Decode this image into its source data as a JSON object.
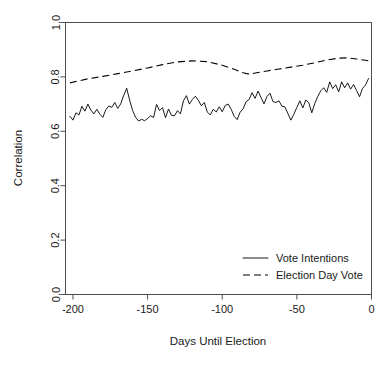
{
  "chart_data": {
    "type": "line",
    "title": "",
    "xlabel": "Days Until Election",
    "ylabel": "Correlation",
    "xlim": [
      -205,
      0
    ],
    "ylim": [
      0.0,
      1.0
    ],
    "grid": false,
    "legend_position": "bottom-right",
    "xticks": [
      -200,
      -150,
      -100,
      -50,
      0
    ],
    "xtick_labels": [
      "-200",
      "-150",
      "-100",
      "-50",
      "0"
    ],
    "yticks": [
      0.0,
      0.2,
      0.4,
      0.6,
      0.8,
      1.0
    ],
    "ytick_labels": [
      "0.0",
      "0.2",
      "0.4",
      "0.6",
      "0.8",
      "1.0"
    ],
    "series": [
      {
        "name": "Vote Intentions",
        "style": "solid",
        "color": "#000000",
        "x": [
          -202,
          -200,
          -198,
          -196,
          -194,
          -192,
          -190,
          -188,
          -186,
          -184,
          -182,
          -180,
          -178,
          -176,
          -174,
          -172,
          -170,
          -168,
          -166,
          -164,
          -162,
          -160,
          -158,
          -156,
          -154,
          -152,
          -150,
          -148,
          -146,
          -144,
          -142,
          -140,
          -138,
          -136,
          -134,
          -132,
          -130,
          -128,
          -126,
          -124,
          -122,
          -120,
          -118,
          -116,
          -114,
          -112,
          -110,
          -108,
          -106,
          -104,
          -102,
          -100,
          -98,
          -96,
          -94,
          -92,
          -90,
          -88,
          -86,
          -84,
          -82,
          -80,
          -78,
          -76,
          -74,
          -72,
          -70,
          -68,
          -66,
          -64,
          -62,
          -60,
          -58,
          -56,
          -54,
          -52,
          -50,
          -48,
          -46,
          -44,
          -42,
          -40,
          -38,
          -36,
          -34,
          -32,
          -30,
          -28,
          -26,
          -24,
          -22,
          -20,
          -18,
          -16,
          -14,
          -12,
          -10,
          -8,
          -6,
          -4,
          -2
        ],
        "values": [
          0.655,
          0.641,
          0.668,
          0.66,
          0.692,
          0.674,
          0.7,
          0.678,
          0.664,
          0.681,
          0.663,
          0.651,
          0.679,
          0.693,
          0.688,
          0.706,
          0.684,
          0.701,
          0.732,
          0.758,
          0.714,
          0.676,
          0.651,
          0.638,
          0.644,
          0.639,
          0.647,
          0.657,
          0.651,
          0.699,
          0.676,
          0.687,
          0.65,
          0.682,
          0.659,
          0.657,
          0.676,
          0.664,
          0.712,
          0.731,
          0.7,
          0.717,
          0.729,
          0.714,
          0.694,
          0.706,
          0.671,
          0.66,
          0.681,
          0.671,
          0.69,
          0.672,
          0.695,
          0.7,
          0.681,
          0.655,
          0.643,
          0.67,
          0.683,
          0.709,
          0.717,
          0.742,
          0.721,
          0.748,
          0.724,
          0.701,
          0.728,
          0.74,
          0.709,
          0.706,
          0.712,
          0.692,
          0.69,
          0.665,
          0.641,
          0.663,
          0.688,
          0.712,
          0.686,
          0.715,
          0.705,
          0.668,
          0.702,
          0.728,
          0.749,
          0.76,
          0.743,
          0.782,
          0.757,
          0.771,
          0.745,
          0.782,
          0.76,
          0.778,
          0.755,
          0.772,
          0.75,
          0.727,
          0.758,
          0.77,
          0.794
        ]
      },
      {
        "name": "Election Day Vote",
        "style": "dashed",
        "color": "#000000",
        "x": [
          -202,
          -190,
          -180,
          -170,
          -160,
          -150,
          -140,
          -130,
          -120,
          -110,
          -100,
          -92,
          -86,
          -82,
          -76,
          -70,
          -62,
          -54,
          -46,
          -38,
          -30,
          -22,
          -16,
          -10,
          -4,
          -2
        ],
        "values": [
          0.778,
          0.793,
          0.802,
          0.812,
          0.822,
          0.833,
          0.845,
          0.855,
          0.859,
          0.856,
          0.843,
          0.828,
          0.815,
          0.81,
          0.816,
          0.822,
          0.829,
          0.836,
          0.843,
          0.852,
          0.862,
          0.869,
          0.87,
          0.866,
          0.861,
          0.859
        ]
      }
    ]
  },
  "legend": {
    "items": [
      {
        "label": "Vote Intentions",
        "style": "solid"
      },
      {
        "label": "Election Day Vote",
        "style": "dashed"
      }
    ]
  }
}
